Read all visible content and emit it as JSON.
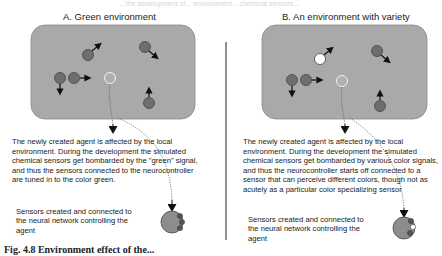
{
  "ghost_text": "...the development of... environment... chemical sensors...",
  "panel_a": {
    "title": "A. Green environment",
    "description": "The newly created agent is affected by the local environment. During the development the simulated chemical sensors get bombarded by the \"green\" signal, and thus the sensors connected to the neurocontroller are tuned in to the color green.",
    "sensor_caption": "Sensors created and connected to the neural network controlling the agent"
  },
  "panel_b": {
    "title": "B. An environment with variety",
    "description": "The newly created agent is affected by the local environment. During the development the simulated chemical sensors get bombarded by various color signals, and thus the neurocontroller starts off connected to a sensor that can perceive different colors, though not as acutely as a particular color specializing sensor",
    "sensor_caption": "Sensors created and connected to the neural network controlling the agent"
  },
  "figure_caption": "Fig. 4.8 Environment effect of the...",
  "colors": {
    "environment_fill": "#a9a9a9",
    "agent_dark": "#6e6e6e",
    "agent_white": "#ffffff",
    "new_agent_fill": "#b0b0b0",
    "arrow": "#111111"
  }
}
